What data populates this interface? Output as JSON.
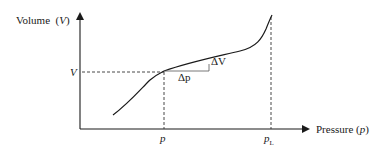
{
  "diagram": {
    "type": "pressure-volume curve",
    "y_axis": {
      "label": "Volume",
      "symbol": "V"
    },
    "x_axis": {
      "label": "Pressure",
      "symbol": "p"
    },
    "marked_point": {
      "v_label": "V",
      "p_label": "p"
    },
    "limit_pressure": {
      "label": "p",
      "subscript": "L"
    },
    "increments": {
      "dp": "Δp",
      "dv": "ΔV"
    },
    "colors": {
      "line": "#1a1a1a",
      "dashed": "#333333",
      "background": "#ffffff"
    }
  }
}
